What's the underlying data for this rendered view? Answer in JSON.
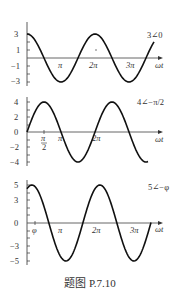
{
  "chart_data": [
    {
      "type": "line",
      "title": "3∠0",
      "xlabel": "ωt",
      "ylabel": "",
      "amplitude": 3,
      "phase": 0,
      "function": "3cos(ωt)",
      "yticks": [
        "3",
        "1",
        "-1",
        "-3"
      ],
      "xticks": [
        "π",
        "2π",
        "3π"
      ],
      "ylim": [
        -3.5,
        3.5
      ],
      "xrange": [
        0,
        3.35
      ]
    },
    {
      "type": "line",
      "title": "4∠−π/2",
      "xlabel": "ωt",
      "ylabel": "",
      "amplitude": 4,
      "phase": -1.5708,
      "function": "4cos(ωt − π/2)",
      "yticks": [
        "4",
        "2",
        "0",
        "-2",
        "-4"
      ],
      "xticks": [
        "π/2",
        "π",
        "2π"
      ],
      "ylim": [
        -4.5,
        4.5
      ],
      "xrange": [
        0,
        3.35
      ]
    },
    {
      "type": "line",
      "title": "5∠−φ",
      "xlabel": "ωt",
      "ylabel": "",
      "amplitude": 5,
      "phase": "-φ",
      "function": "5cos(ωt − φ)",
      "yticks": [
        "5",
        "3",
        "0",
        "-3",
        "-5"
      ],
      "xticks": [
        "φ",
        "π",
        "2π",
        "3π"
      ],
      "ylim": [
        -5.5,
        5.5
      ],
      "xrange": [
        0,
        3.35
      ]
    }
  ],
  "charts": {
    "c1": {
      "label": "3∠0",
      "y": [
        "3",
        "1",
        "−1",
        "−3"
      ],
      "x": [
        "π",
        "2π",
        "3π"
      ],
      "axis": "ωt"
    },
    "c2": {
      "label": "4∠−π/2",
      "y": [
        "4",
        "2",
        "0",
        "−2",
        "−4"
      ],
      "x": [
        "π",
        "2π"
      ],
      "x_half_num": "π",
      "x_half_den": "2",
      "axis": "ωt"
    },
    "c3": {
      "label": "5∠−φ",
      "y": [
        "5",
        "3",
        "0",
        "−3",
        "−5"
      ],
      "x": [
        "φ",
        "π",
        "2π",
        "3π"
      ],
      "axis": "ωt"
    }
  },
  "caption": "题图 P.7.10"
}
